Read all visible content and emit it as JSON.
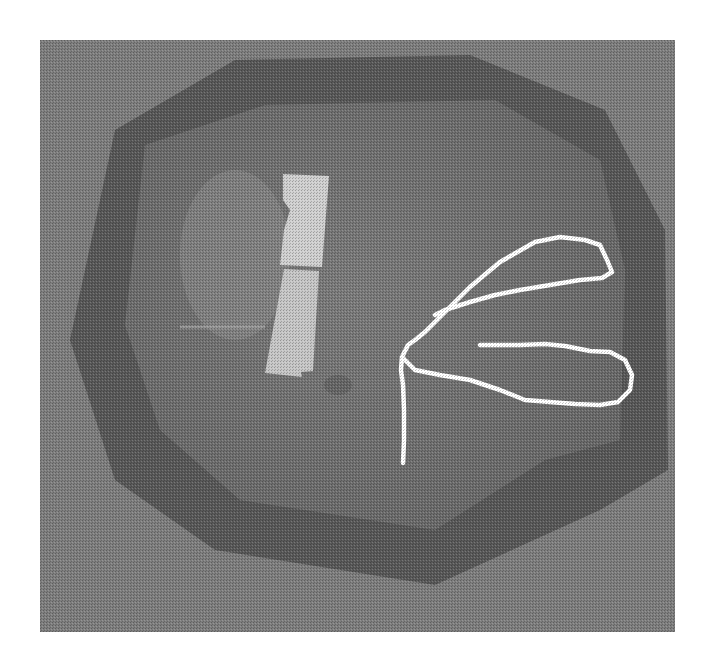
{
  "image": {
    "kind": "grayscale-halftone-photograph",
    "description": "Top-down view of an octagonal arena/tank with a light rectangular object and a white traced movement path forming two loops",
    "colors": {
      "background_page": "#ffffff",
      "photo_base": "#7a7a7a",
      "arena_floor": "#727272",
      "arena_rim_dark": "#555555",
      "outer_area": "#808080",
      "object_light": "#cfcfcf",
      "path_white": "#ffffff",
      "reflection_light": "#9a9a9a"
    }
  }
}
